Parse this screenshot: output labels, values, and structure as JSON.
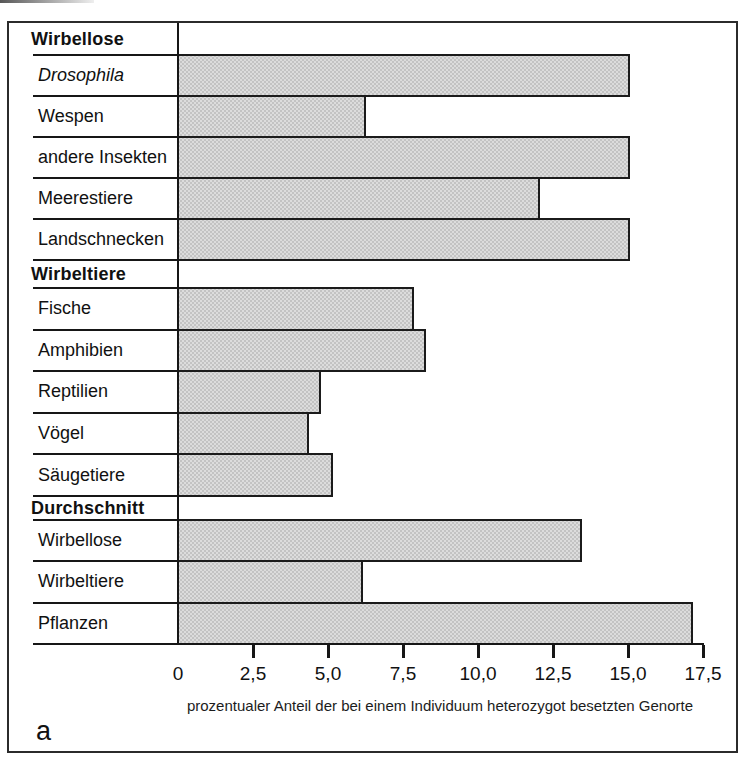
{
  "chart_data": {
    "type": "bar",
    "orientation": "horizontal",
    "title": "",
    "figure_label": "a",
    "sections": [
      {
        "header": "Wirbellose",
        "rows": [
          {
            "label": "Drosophila",
            "italic": true,
            "value": 15.0
          },
          {
            "label": "Wespen",
            "italic": false,
            "value": 6.2
          },
          {
            "label": "andere Insekten",
            "italic": false,
            "value": 15.0
          },
          {
            "label": "Meerestiere",
            "italic": false,
            "value": 12.0
          },
          {
            "label": "Landschnecken",
            "italic": false,
            "value": 15.0
          }
        ]
      },
      {
        "header": "Wirbeltiere",
        "rows": [
          {
            "label": "Fische",
            "italic": false,
            "value": 7.8
          },
          {
            "label": "Amphibien",
            "italic": false,
            "value": 8.2
          },
          {
            "label": "Reptilien",
            "italic": false,
            "value": 4.7
          },
          {
            "label": "Vögel",
            "italic": false,
            "value": 4.3
          },
          {
            "label": "Säugetiere",
            "italic": false,
            "value": 5.1
          }
        ]
      },
      {
        "header": "Durchschnitt",
        "rows": [
          {
            "label": "Wirbellose",
            "italic": false,
            "value": 13.4
          },
          {
            "label": "Wirbeltiere",
            "italic": false,
            "value": 6.1
          },
          {
            "label": "Pflanzen",
            "italic": false,
            "value": 17.1
          }
        ]
      }
    ],
    "x_axis": {
      "min": 0,
      "max": 17.5,
      "ticks": [
        {
          "value": 0,
          "label": "0"
        },
        {
          "value": 2.5,
          "label": "2,5"
        },
        {
          "value": 5,
          "label": "5,0"
        },
        {
          "value": 7.5,
          "label": "7,5"
        },
        {
          "value": 10,
          "label": "10,0"
        },
        {
          "value": 12.5,
          "label": "12,5"
        },
        {
          "value": 15,
          "label": "15,0"
        },
        {
          "value": 17.5,
          "label": "17,5"
        }
      ],
      "label": "prozentualer Anteil der bei einem Individuum heterozygot besetzten Genorte"
    },
    "colors": {
      "bar_fill": "#dcdcdc",
      "bar_dot": "#c3c3c3",
      "line": "#161616",
      "frame": "#2b2b2b",
      "background": "#ffffff"
    },
    "grid": false,
    "legend": null
  }
}
